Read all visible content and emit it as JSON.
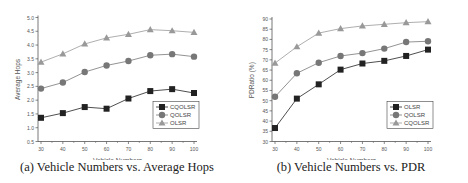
{
  "chart_data": [
    {
      "type": "line",
      "title": "",
      "caption": "(a) Vehicle Numbers vs. Average Hops",
      "xlabel": "Vehicle Numbers",
      "ylabel": "Average Hops",
      "x": [
        30,
        40,
        50,
        60,
        70,
        80,
        90,
        100
      ],
      "ylim": [
        0.5,
        5.0
      ],
      "yticks": [
        0.5,
        1.0,
        1.5,
        2.0,
        2.5,
        3.0,
        3.5,
        4.0,
        4.5,
        5.0
      ],
      "ytick_labels": [
        "0.5",
        "1.0",
        "1.5",
        "2.0",
        "2.5",
        "3.0",
        "3.5",
        "4.0",
        "4.5",
        "5.0"
      ],
      "grid": false,
      "legend_position": "lower right",
      "series": [
        {
          "name": "CQOLSR",
          "marker": "square",
          "color": "#222222",
          "values": [
            1.36,
            1.53,
            1.75,
            1.69,
            2.06,
            2.33,
            2.4,
            2.26
          ]
        },
        {
          "name": "QOLSR",
          "marker": "circle",
          "color": "#777777",
          "values": [
            2.42,
            2.64,
            3.02,
            3.26,
            3.42,
            3.63,
            3.67,
            3.58
          ]
        },
        {
          "name": "OLSR",
          "marker": "triangle",
          "color": "#999999",
          "values": [
            3.38,
            3.68,
            4.04,
            4.26,
            4.39,
            4.56,
            4.52,
            4.46
          ]
        }
      ]
    },
    {
      "type": "line",
      "title": "",
      "caption": "(b) Vehicle Numbers vs. PDR",
      "xlabel": "Vehicle Numbers",
      "ylabel": "PDRatio (%)",
      "x": [
        30,
        40,
        50,
        60,
        70,
        80,
        90,
        100
      ],
      "ylim": [
        30,
        90
      ],
      "yticks": [
        30,
        35,
        40,
        45,
        50,
        55,
        60,
        65,
        70,
        75,
        80,
        85,
        90
      ],
      "ytick_labels": [
        "30",
        "35",
        "40",
        "45",
        "50",
        "55",
        "60",
        "65",
        "70",
        "75",
        "80",
        "85",
        "90"
      ],
      "grid": false,
      "legend_position": "lower right",
      "series": [
        {
          "name": "OLSR",
          "marker": "square",
          "color": "#222222",
          "values": [
            36.6,
            51.0,
            58.0,
            65.2,
            68.2,
            69.5,
            71.9,
            75.0
          ]
        },
        {
          "name": "QOLSR",
          "marker": "circle",
          "color": "#777777",
          "values": [
            51.9,
            63.4,
            68.6,
            71.9,
            73.3,
            75.5,
            78.7,
            79.1
          ]
        },
        {
          "name": "CQOLSR",
          "marker": "triangle",
          "color": "#999999",
          "values": [
            68.4,
            76.4,
            83.1,
            85.3,
            86.6,
            87.4,
            88.2,
            88.7
          ]
        }
      ]
    }
  ],
  "captions": {
    "a": "(a) Vehicle Numbers vs. Average Hops",
    "b": "(b) Vehicle Numbers vs. PDR"
  }
}
